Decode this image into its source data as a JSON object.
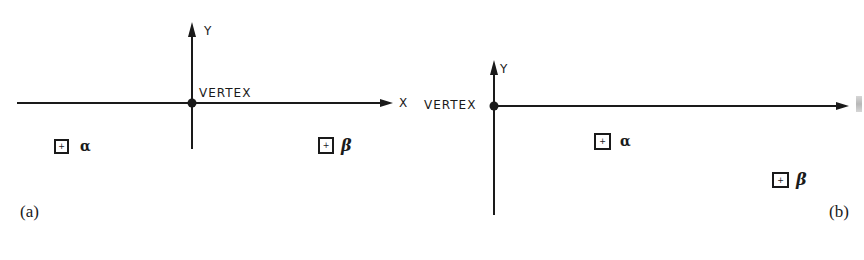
{
  "figure": {
    "panel_a": {
      "caption": "(a)",
      "x_axis_label": "X",
      "y_axis_label": "Y",
      "vertex_label": "VERTEX",
      "sources": [
        {
          "symbol": "α",
          "name": "alpha"
        },
        {
          "symbol": "β",
          "name": "beta"
        }
      ],
      "box_marker": "+"
    },
    "panel_b": {
      "caption": "(b)",
      "y_axis_label": "Y",
      "vertex_label": "VERTEX",
      "sources": [
        {
          "symbol": "α",
          "name": "alpha"
        },
        {
          "symbol": "β",
          "name": "beta"
        }
      ],
      "box_marker": "+"
    },
    "colors": {
      "ink": "#1a1a1a",
      "background": "#ffffff"
    }
  }
}
